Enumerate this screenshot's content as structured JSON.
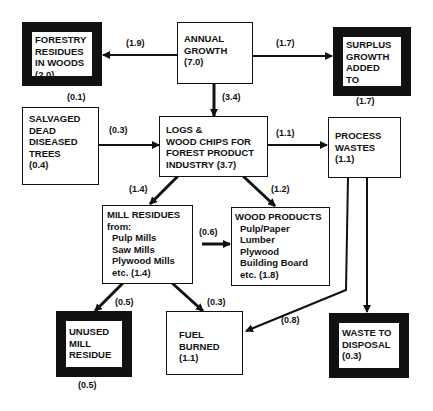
{
  "nodes": {
    "forestry_residues": {
      "lines": [
        "FORESTRY",
        "RESIDUES",
        "IN WOODS",
        "(2.0)"
      ]
    },
    "annual_growth": {
      "lines": [
        "ANNUAL",
        "GROWTH",
        "(7.0)"
      ]
    },
    "surplus_growth": {
      "lines": [
        "SURPLUS",
        "GROWTH",
        "ADDED",
        "TO",
        "FORESTS"
      ]
    },
    "salvaged_trees": {
      "lines": [
        "SALVAGED",
        "DEAD",
        "DISEASED",
        "TREES",
        "(0.4)"
      ]
    },
    "logs_chips": {
      "lines": [
        "LOGS &",
        "WOOD CHIPS FOR",
        "FOREST PRODUCT",
        "INDUSTRY (3.7)"
      ]
    },
    "process_wastes": {
      "lines": [
        "PROCESS",
        "WASTES",
        "(1.1)"
      ]
    },
    "mill_residues": {
      "lines": [
        "MILL RESIDUES",
        "from:",
        "Pulp Mills",
        "Saw Mills",
        "Plywood Mills",
        "etc. (1.4)"
      ]
    },
    "wood_products": {
      "lines": [
        "WOOD PRODUCTS",
        "Pulp/Paper",
        "Lumber",
        "Plywood",
        "Building Board",
        "etc. (1.8)"
      ]
    },
    "unused_mill_residue": {
      "lines": [
        "UNUSED",
        "MILL",
        "RESIDUE"
      ]
    },
    "fuel_burned": {
      "lines": [
        "FUEL",
        "BURNED",
        "(1.1)"
      ]
    },
    "waste_disposal": {
      "lines": [
        "WASTE TO",
        "DISPOSAL",
        "(0.3)"
      ]
    }
  },
  "flows": {
    "growth_to_residues": "(1.9)",
    "growth_to_surplus": "(1.7)",
    "surplus_total": "(1.7)",
    "residues_note": "(0.1)",
    "growth_to_logs": "(3.4)",
    "salvaged_to_logs": "(0.3)",
    "logs_to_wastes": "(1.1)",
    "logs_to_mill": "(1.4)",
    "logs_to_products": "(1.2)",
    "mill_to_products": "(0.6)",
    "mill_to_unused": "(0.5)",
    "mill_to_fuel": "(0.3)",
    "wastes_to_fuel": "(0.8)",
    "unused_total": "(0.5)"
  }
}
